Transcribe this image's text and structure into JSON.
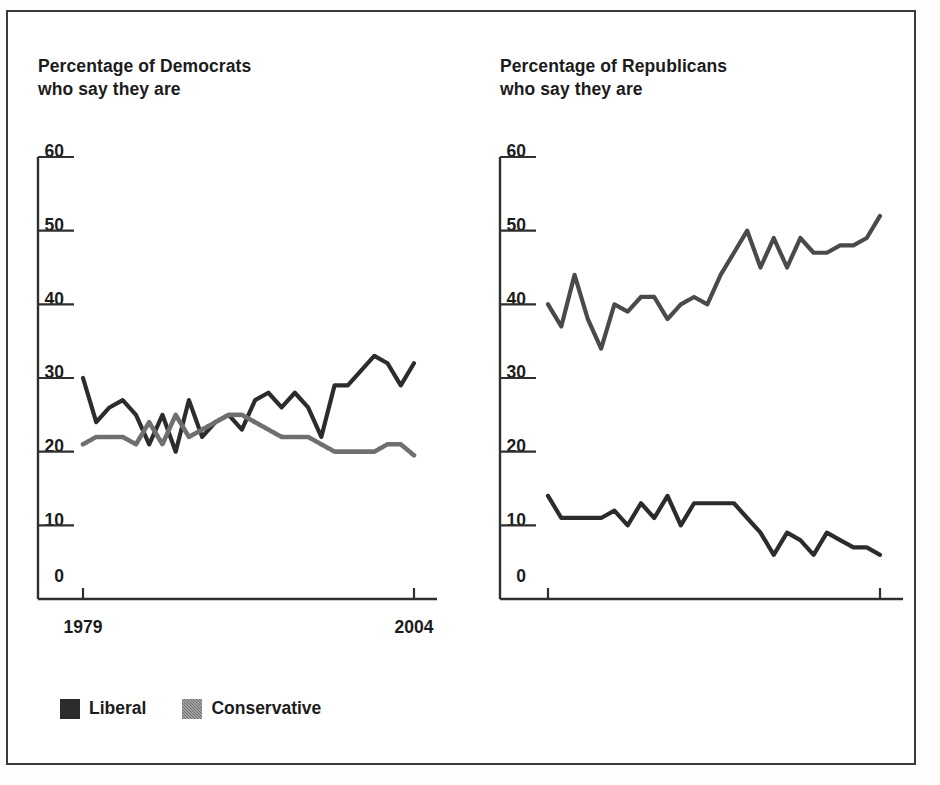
{
  "figure": {
    "background": "#ffffff",
    "border_color": "#3a3a3a"
  },
  "legend": {
    "position": "bottom-left",
    "items": [
      {
        "label": "Liberal",
        "color": "#2c2c2c",
        "swatch": "liberal-swatch"
      },
      {
        "label": "Conservative",
        "color": "#6f6f6f",
        "swatch": "conservative-swatch"
      }
    ]
  },
  "panels": {
    "left": {
      "title": "Percentage of Democrats\nwho say they are",
      "title_line1": "Percentage of Democrats",
      "title_line2": "who say they are",
      "y_ticks": [
        "0",
        "10",
        "20",
        "30",
        "40",
        "50",
        "60"
      ],
      "x_ticks": [
        "1979",
        "2004"
      ]
    },
    "right": {
      "title": "Percentage of Republicans\nwho say they are",
      "title_line1": "Percentage of Republicans",
      "title_line2": "who say they are",
      "y_ticks": [
        "0",
        "10",
        "20",
        "30",
        "40",
        "50",
        "60"
      ],
      "x_ticks": [
        "1979",
        "2004"
      ]
    }
  },
  "chart_data": [
    {
      "type": "line",
      "id": "democrats",
      "title": "Percentage of Democrats who say they are",
      "xlabel": "",
      "ylabel": "",
      "xlim": [
        1979,
        2004
      ],
      "ylim": [
        0,
        60
      ],
      "yticks": [
        0,
        10,
        20,
        30,
        40,
        50,
        60
      ],
      "xticks": [
        1979,
        2004
      ],
      "grid": false,
      "legend": "bottom-left",
      "x": [
        1979,
        1980,
        1981,
        1982,
        1983,
        1984,
        1985,
        1986,
        1987,
        1988,
        1989,
        1990,
        1991,
        1992,
        1993,
        1994,
        1995,
        1996,
        1997,
        1998,
        1999,
        2000,
        2001,
        2002,
        2003,
        2004
      ],
      "series": [
        {
          "name": "Liberal",
          "color": "#2c2c2c",
          "values": [
            30,
            24,
            26,
            27,
            25,
            21,
            25,
            20,
            27,
            22,
            24,
            25,
            23,
            27,
            28,
            26,
            28,
            26,
            22,
            29,
            29,
            31,
            33,
            32,
            29,
            32
          ]
        },
        {
          "name": "Conservative",
          "color": "#6f6f6f",
          "values": [
            21,
            22,
            22,
            22,
            21,
            24,
            21,
            25,
            22,
            23,
            24,
            25,
            25,
            24,
            23,
            22,
            22,
            22,
            21,
            20,
            20,
            20,
            20,
            21,
            21,
            19.5
          ]
        }
      ]
    },
    {
      "type": "line",
      "id": "republicans",
      "title": "Percentage of Republicans who say they are",
      "xlabel": "",
      "ylabel": "",
      "xlim": [
        1979,
        2004
      ],
      "ylim": [
        0,
        60
      ],
      "yticks": [
        0,
        10,
        20,
        30,
        40,
        50,
        60
      ],
      "xticks": [
        1979,
        2004
      ],
      "grid": false,
      "legend": "bottom-left",
      "x": [
        1979,
        1980,
        1981,
        1982,
        1983,
        1984,
        1985,
        1986,
        1987,
        1988,
        1989,
        1990,
        1991,
        1992,
        1993,
        1994,
        1995,
        1996,
        1997,
        1998,
        1999,
        2000,
        2001,
        2002,
        2003,
        2004
      ],
      "series": [
        {
          "name": "Conservative",
          "color": "#4a4a4a",
          "values": [
            40,
            37,
            44,
            38,
            34,
            40,
            39,
            41,
            41,
            38,
            40,
            41,
            40,
            44,
            47,
            50,
            45,
            49,
            45,
            49,
            47,
            47,
            48,
            48,
            49,
            52
          ]
        },
        {
          "name": "Liberal",
          "color": "#2c2c2c",
          "values": [
            14,
            11,
            11,
            11,
            11,
            12,
            10,
            13,
            11,
            14,
            10,
            13,
            13,
            13,
            13,
            11,
            9,
            6,
            9,
            8,
            6,
            9,
            8,
            7,
            7,
            6
          ]
        }
      ]
    }
  ]
}
